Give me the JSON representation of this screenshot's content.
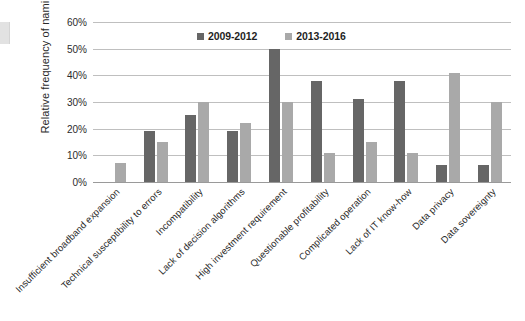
{
  "chart_data": {
    "type": "bar",
    "title": "",
    "xlabel": "",
    "ylabel": "Relative frequency of namings",
    "ylim": [
      0,
      60
    ],
    "ytick_labels": [
      "60%",
      "50%",
      "40%",
      "30%",
      "20%",
      "10%",
      "0%"
    ],
    "ytick_values": [
      60,
      50,
      40,
      30,
      20,
      10,
      0
    ],
    "grid": true,
    "legend_position": "top-center",
    "categories": [
      "Insufficient broadband expansion",
      "Technical susceptibility to errors",
      "Incompatibility",
      "Lack of decision algorithms",
      "High investment requirement",
      "Questionable profitability",
      "Complicated operation",
      "Lack of IT know-how",
      "Data privacy",
      "Data sovereignty"
    ],
    "series": [
      {
        "name": "2009-2012",
        "color": "#666666",
        "values": [
          0,
          19,
          25,
          19,
          50,
          38,
          31,
          38,
          6.5,
          6.5
        ]
      },
      {
        "name": "2013-2016",
        "color": "#a9a9a9",
        "values": [
          7,
          15,
          30,
          22,
          30,
          11,
          15,
          11,
          41,
          30
        ]
      }
    ]
  },
  "colors": {
    "series_2009_2012": "#666666",
    "series_2013_2016": "#a9a9a9",
    "gridline": "#bfbfbf",
    "axis": "#9a9a9a",
    "text": "#2b2b2b",
    "background": "#ffffff"
  }
}
